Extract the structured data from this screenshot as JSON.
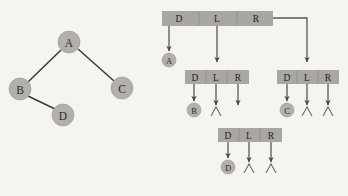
{
  "figure": {
    "background_color": "#f6f4ef",
    "node_fill": "#b2b0ab",
    "cell_fill": "#a9a7a2",
    "line_color": "#3a3a38",
    "pointer_color": "#59585a"
  },
  "tree": {
    "caption": "Binary tree",
    "nodes": [
      {
        "id": "A",
        "label": "A",
        "cx": 69,
        "cy": 42,
        "r": 11
      },
      {
        "id": "B",
        "label": "B",
        "cx": 20,
        "cy": 89,
        "r": 11
      },
      {
        "id": "C",
        "label": "C",
        "cx": 122,
        "cy": 88,
        "r": 11
      },
      {
        "id": "D",
        "label": "D",
        "cx": 63,
        "cy": 115,
        "r": 11
      }
    ],
    "edges": [
      {
        "from": "A",
        "to": "B",
        "x1": 61,
        "y1": 50,
        "x2": 28,
        "y2": 82
      },
      {
        "from": "A",
        "to": "C",
        "x1": 78,
        "y1": 49,
        "x2": 114,
        "y2": 81
      },
      {
        "from": "B",
        "to": "D",
        "x1": 28,
        "y1": 96,
        "x2": 55,
        "y2": 109
      }
    ]
  },
  "linked_representation": {
    "caption": "Linked representation",
    "cell_labels": {
      "data": "D",
      "left": "L",
      "right": "R"
    },
    "null_symbol": "∧",
    "boxes": [
      {
        "id": "box-root",
        "node": "A",
        "x": 162,
        "y": 11,
        "width": 111,
        "height": 15,
        "cells": [
          {
            "field": "data",
            "label": "D",
            "cx": 179
          },
          {
            "field": "left",
            "label": "L",
            "cx": 217
          },
          {
            "field": "right",
            "label": "R",
            "cx": 256
          }
        ]
      },
      {
        "id": "box-b",
        "node": "B",
        "x": 185,
        "y": 70,
        "width": 64,
        "height": 14,
        "cells": [
          {
            "field": "data",
            "label": "D",
            "cx": 195
          },
          {
            "field": "left",
            "label": "L",
            "cx": 216
          },
          {
            "field": "right",
            "label": "R",
            "cx": 238
          }
        ]
      },
      {
        "id": "box-c",
        "node": "C",
        "x": 277,
        "y": 70,
        "width": 62,
        "height": 14,
        "cells": [
          {
            "field": "data",
            "label": "D",
            "cx": 287
          },
          {
            "field": "left",
            "label": "L",
            "cx": 307
          },
          {
            "field": "right",
            "label": "R",
            "cx": 328
          }
        ]
      },
      {
        "id": "box-d",
        "node": "D",
        "x": 218,
        "y": 128,
        "width": 64,
        "height": 14,
        "cells": [
          {
            "field": "data",
            "label": "D",
            "cx": 228
          },
          {
            "field": "left",
            "label": "L",
            "cx": 249
          },
          {
            "field": "right",
            "label": "R",
            "cx": 271
          }
        ]
      }
    ],
    "data_nodes": [
      {
        "id": "lr-node-a",
        "label": "A",
        "cx": 169,
        "cy": 60,
        "r": 7
      },
      {
        "id": "lr-node-b",
        "label": "B",
        "cx": 194,
        "cy": 110,
        "r": 7
      },
      {
        "id": "lr-node-c",
        "label": "C",
        "cx": 287,
        "cy": 110,
        "r": 7
      },
      {
        "id": "lr-node-d",
        "label": "D",
        "cx": 228,
        "cy": 167,
        "r": 7
      }
    ],
    "nulls": [
      {
        "id": "null-b-left",
        "x": 216,
        "y": 112
      },
      {
        "id": "null-c-left",
        "x": 307,
        "y": 112
      },
      {
        "id": "null-c-right",
        "x": 328,
        "y": 112
      },
      {
        "id": "null-d-left",
        "x": 249,
        "y": 169
      },
      {
        "id": "null-d-right",
        "x": 271,
        "y": 169
      }
    ]
  }
}
